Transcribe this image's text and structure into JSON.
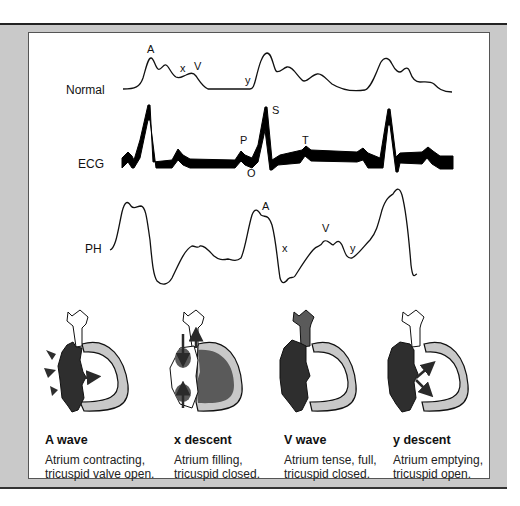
{
  "traces": {
    "normal": {
      "label": "Normal",
      "markers": {
        "a": "A",
        "x": "x",
        "v": "V",
        "y": "y"
      }
    },
    "ecg": {
      "label": "ECG",
      "markers": {
        "p": "P",
        "o": "O",
        "s": "S",
        "t": "T"
      }
    },
    "ph": {
      "label": "PH",
      "markers": {
        "a": "A",
        "x": "x",
        "v": "V",
        "y": "y"
      }
    }
  },
  "phases": [
    {
      "title": "A wave",
      "line1": "Atrium contracting,",
      "line2": "tricuspid valve open."
    },
    {
      "title": "x descent",
      "line1": "Atrium filling,",
      "line2": "tricuspid closed."
    },
    {
      "title": "V wave",
      "line1": "Atrium tense, full,",
      "line2": "tricuspid closed."
    },
    {
      "title": "y descent",
      "line1": "Atrium emptying,",
      "line2": "tricuspid open."
    }
  ],
  "colors": {
    "frame": "#c9c9c9",
    "atrium_dark": "#2e2e2e",
    "ventricle_mid": "#5a5a5a",
    "ventricle_wall": "#c8c8c8"
  }
}
